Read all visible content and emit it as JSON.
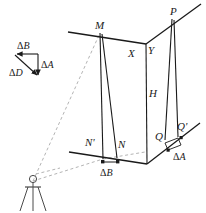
{
  "figure": {
    "type": "surveying-diagram",
    "colors": {
      "line": "#1a1a1a",
      "dashed": "#b0b0b0",
      "text": "#1a1a1a",
      "background": "#ffffff"
    }
  },
  "vector_triangle": {
    "name": "error-vector-triangle",
    "components": [
      {
        "id": "dB",
        "label_greek": "Δ",
        "label_italic": "B",
        "full": "ΔB",
        "direction": "horizontal-left",
        "position": "top"
      },
      {
        "id": "dA",
        "label_greek": "Δ",
        "label_italic": "A",
        "full": "ΔA",
        "direction": "vertical-down",
        "position": "right"
      },
      {
        "id": "dD",
        "label_greek": "Δ",
        "label_italic": "D",
        "full": "ΔD",
        "direction": "diagonal-down-right",
        "position": "hypotenuse"
      }
    ]
  },
  "points": {
    "M": {
      "label": "M",
      "role": "roof-corner-left"
    },
    "P": {
      "label": "P",
      "role": "roof-corner-right"
    },
    "X": {
      "label": "X",
      "role": "eave-left-of-corner"
    },
    "Y": {
      "label": "Y",
      "role": "eave-right-of-corner"
    },
    "H": {
      "label": "H",
      "role": "building-height"
    },
    "N": {
      "label": "N",
      "role": "base-point-right"
    },
    "Nprime": {
      "label": "N'",
      "role": "base-point-left"
    },
    "Q": {
      "label": "Q",
      "role": "base-corner-right"
    },
    "Qprime": {
      "label": "Q'",
      "role": "base-offset-right"
    },
    "O": {
      "label": "",
      "role": "instrument-station"
    }
  },
  "measurements": [
    {
      "id": "deltaB-ground",
      "label_greek": "Δ",
      "label_italic": "B",
      "full": "ΔB",
      "location": "bottom-center",
      "between": [
        "N'",
        "N"
      ]
    },
    {
      "id": "deltaA-ground",
      "label_greek": "Δ",
      "label_italic": "A",
      "full": "ΔA",
      "location": "bottom-right",
      "between": [
        "Q",
        "Q'"
      ]
    }
  ],
  "instrument": {
    "name": "theodolite-on-tripod",
    "legs": 3,
    "sight_lines": [
      "to-M",
      "to-ground-base"
    ]
  }
}
